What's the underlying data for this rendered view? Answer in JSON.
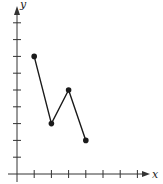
{
  "chart_data": {
    "type": "line",
    "title": "",
    "xlabel": "x",
    "ylabel": "y",
    "x": [
      1,
      2,
      3,
      4
    ],
    "values": [
      7,
      3,
      5,
      2
    ],
    "series": [
      {
        "name": "",
        "x": [
          1,
          2,
          3,
          4
        ],
        "y": [
          7,
          3,
          5,
          2
        ],
        "markers": true
      }
    ],
    "x_ticks": [
      1,
      2,
      3,
      4,
      5,
      6,
      7
    ],
    "y_ticks": [
      1,
      2,
      3,
      4,
      5,
      6,
      7,
      8,
      9
    ],
    "xlim": [
      0,
      8
    ],
    "ylim": [
      0,
      10
    ],
    "tick_labels_shown": false,
    "grid": false,
    "legend": null
  },
  "style": {
    "line_color": "#1a1a1a",
    "axis_color": "#333333"
  }
}
